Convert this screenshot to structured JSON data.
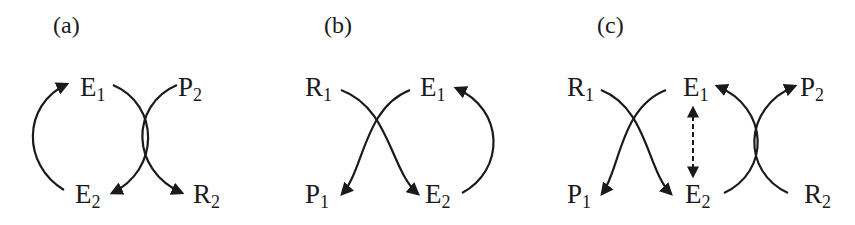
{
  "figure": {
    "type": "reaction-cycle-diagram",
    "colors": {
      "ink": "#1a1a1a",
      "background": "#ffffff"
    },
    "panels": [
      {
        "id": "a",
        "label": "(a)",
        "nodes": [
          {
            "id": "E1",
            "base": "E",
            "sub": "1"
          },
          {
            "id": "P2",
            "base": "P",
            "sub": "2"
          },
          {
            "id": "E2",
            "base": "E",
            "sub": "2"
          },
          {
            "id": "R2",
            "base": "R",
            "sub": "2"
          }
        ],
        "arrows": [
          {
            "from": "E2",
            "to": "E1",
            "style": "solid-arc"
          },
          {
            "from": "E1",
            "to": "E2",
            "style": "solid-crossing"
          },
          {
            "from": "P2",
            "to": "R2",
            "style": "solid-crossing"
          }
        ]
      },
      {
        "id": "b",
        "label": "(b)",
        "nodes": [
          {
            "id": "R1",
            "base": "R",
            "sub": "1"
          },
          {
            "id": "E1",
            "base": "E",
            "sub": "1"
          },
          {
            "id": "P1",
            "base": "P",
            "sub": "1"
          },
          {
            "id": "E2",
            "base": "E",
            "sub": "2"
          }
        ],
        "arrows": [
          {
            "from": "R1",
            "to": "P1",
            "style": "solid-crossing"
          },
          {
            "from": "E1",
            "to": "E2",
            "style": "solid-crossing"
          },
          {
            "from": "E2",
            "to": "E1",
            "style": "solid-arc"
          }
        ]
      },
      {
        "id": "c",
        "label": "(c)",
        "nodes": [
          {
            "id": "R1",
            "base": "R",
            "sub": "1"
          },
          {
            "id": "E1",
            "base": "E",
            "sub": "1"
          },
          {
            "id": "P2",
            "base": "P",
            "sub": "2"
          },
          {
            "id": "P1",
            "base": "P",
            "sub": "1"
          },
          {
            "id": "E2",
            "base": "E",
            "sub": "2"
          },
          {
            "id": "R2",
            "base": "R",
            "sub": "2"
          }
        ],
        "arrows": [
          {
            "from": "R1",
            "to": "P1",
            "style": "solid-crossing"
          },
          {
            "from": "E1",
            "to": "E2",
            "style": "solid-crossing"
          },
          {
            "from": "E1",
            "to": "E2",
            "style": "dashed-bidirectional"
          },
          {
            "from": "E2",
            "to": "E1",
            "style": "solid-crossing"
          },
          {
            "from": "R2",
            "to": "P2",
            "style": "solid-crossing"
          }
        ]
      }
    ]
  }
}
